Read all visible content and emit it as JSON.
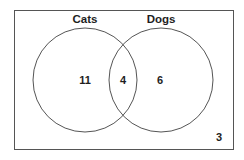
{
  "diagram": {
    "type": "venn",
    "universe": {
      "outside_count": "3"
    },
    "sets": [
      {
        "label": "Cats",
        "only_count": "11"
      },
      {
        "label": "Dogs",
        "only_count": "6"
      }
    ],
    "intersection": {
      "count": "4"
    },
    "colors": {
      "stroke": "#555555",
      "text": "#1e1e1e",
      "background": "#ffffff"
    }
  }
}
